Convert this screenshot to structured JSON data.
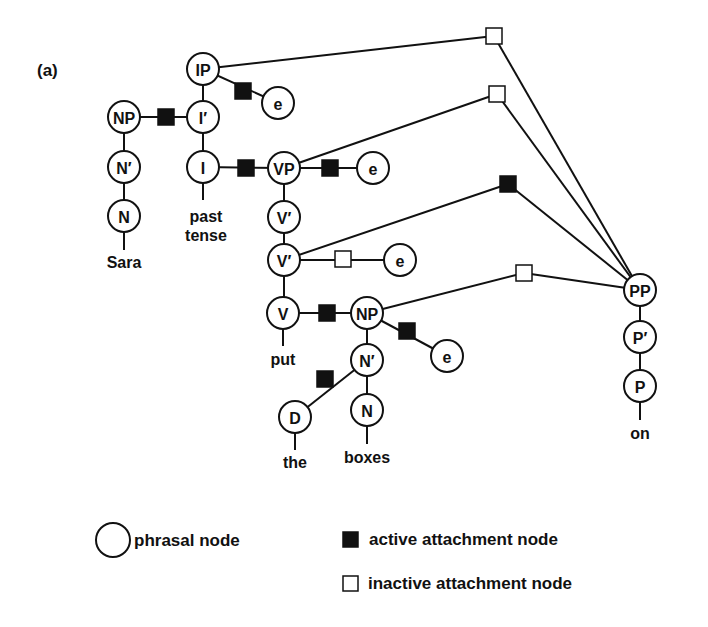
{
  "panel_label": "(a)",
  "colors": {
    "ink": "#111111",
    "background": "#ffffff"
  },
  "nodes": [
    {
      "id": "IP",
      "label": "IP",
      "x": 203,
      "y": 69
    },
    {
      "id": "Ibar",
      "label": "I′",
      "x": 203,
      "y": 117
    },
    {
      "id": "I",
      "label": "I",
      "x": 203,
      "y": 167
    },
    {
      "id": "NP1",
      "label": "NP",
      "x": 124,
      "y": 117
    },
    {
      "id": "Nbar1",
      "label": "N′",
      "x": 124,
      "y": 167
    },
    {
      "id": "N1",
      "label": "N",
      "x": 124,
      "y": 216
    },
    {
      "id": "e1",
      "label": "e",
      "x": 278,
      "y": 103
    },
    {
      "id": "VP",
      "label": "VP",
      "x": 284,
      "y": 168
    },
    {
      "id": "e2",
      "label": "e",
      "x": 373,
      "y": 168
    },
    {
      "id": "Vbar1",
      "label": "V′",
      "x": 284,
      "y": 217
    },
    {
      "id": "Vbar2",
      "label": "V′",
      "x": 284,
      "y": 260
    },
    {
      "id": "e3",
      "label": "e",
      "x": 400,
      "y": 260
    },
    {
      "id": "V",
      "label": "V",
      "x": 283,
      "y": 313
    },
    {
      "id": "NP2",
      "label": "NP",
      "x": 367,
      "y": 313
    },
    {
      "id": "e4",
      "label": "e",
      "x": 447,
      "y": 356
    },
    {
      "id": "Nbar2",
      "label": "N′",
      "x": 367,
      "y": 360
    },
    {
      "id": "D",
      "label": "D",
      "x": 295,
      "y": 417
    },
    {
      "id": "N2",
      "label": "N",
      "x": 367,
      "y": 410
    },
    {
      "id": "PP",
      "label": "PP",
      "x": 640,
      "y": 290
    },
    {
      "id": "Pbar",
      "label": "P′",
      "x": 640,
      "y": 337
    },
    {
      "id": "P",
      "label": "P",
      "x": 640,
      "y": 386
    }
  ],
  "words": [
    {
      "text": "Sara",
      "x": 124,
      "y": 268
    },
    {
      "text": "past",
      "x": 206,
      "y": 222
    },
    {
      "text": "tense",
      "x": 206,
      "y": 241
    },
    {
      "text": "put",
      "x": 283,
      "y": 365
    },
    {
      "text": "the",
      "x": 295,
      "y": 468
    },
    {
      "text": "boxes",
      "x": 367,
      "y": 463
    },
    {
      "text": "on",
      "x": 640,
      "y": 439
    }
  ],
  "attachment_nodes": [
    {
      "id": "a1",
      "type": "active",
      "x": 166,
      "y": 117
    },
    {
      "id": "a2",
      "type": "active",
      "x": 243,
      "y": 91
    },
    {
      "id": "a3",
      "type": "active",
      "x": 246,
      "y": 168
    },
    {
      "id": "a4",
      "type": "active",
      "x": 330,
      "y": 168
    },
    {
      "id": "a5",
      "type": "inactive",
      "x": 343,
      "y": 259
    },
    {
      "id": "a6",
      "type": "active",
      "x": 327,
      "y": 313
    },
    {
      "id": "a7",
      "type": "active",
      "x": 407,
      "y": 331
    },
    {
      "id": "a8",
      "type": "active",
      "x": 325,
      "y": 379
    },
    {
      "id": "a9",
      "type": "inactive",
      "x": 494,
      "y": 36
    },
    {
      "id": "a10",
      "type": "inactive",
      "x": 497,
      "y": 94
    },
    {
      "id": "a11",
      "type": "active",
      "x": 508,
      "y": 184
    },
    {
      "id": "a12",
      "type": "inactive",
      "x": 524,
      "y": 273
    }
  ],
  "legend": {
    "phrasal": "phrasal node",
    "active": "active attachment node",
    "inactive": "inactive attachment node"
  }
}
